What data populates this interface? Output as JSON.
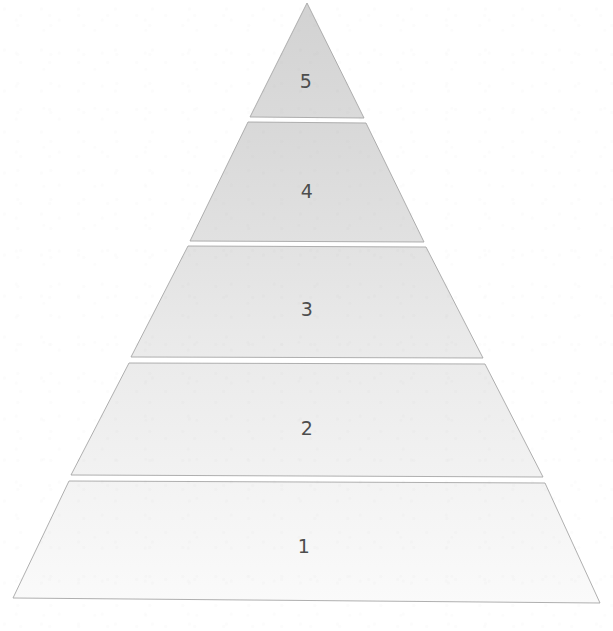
{
  "figure": {
    "type": "pyramid-diagram",
    "title": "",
    "orientation": "apex-up",
    "level_count": 5,
    "background_color": "#ffffff",
    "outline_color": "#9a9a9a",
    "label_color": "#4d4d4d",
    "divider_gap_color": "#ffffff",
    "apex": {
      "x": 307,
      "y": 3
    },
    "base_left": {
      "x": 13,
      "y": 598
    },
    "base_right": {
      "x": 600,
      "y": 603
    },
    "levels": [
      {
        "label": "5",
        "rank_from_top": 1,
        "fill_color": "#d7d7d7",
        "top_y": 3,
        "bottom_y": 117,
        "label_x": 306,
        "label_y": 81
      },
      {
        "label": "4",
        "rank_from_top": 2,
        "fill_color": "#dcdcdc",
        "top_y": 122,
        "bottom_y": 241,
        "label_x": 307,
        "label_y": 191
      },
      {
        "label": "3",
        "rank_from_top": 3,
        "fill_color": "#e6e6e6",
        "top_y": 246,
        "bottom_y": 357,
        "label_x": 307,
        "label_y": 309
      },
      {
        "label": "2",
        "rank_from_top": 4,
        "fill_color": "#eeeeee",
        "top_y": 363,
        "bottom_y": 475,
        "label_x": 307,
        "label_y": 428
      },
      {
        "label": "1",
        "rank_from_top": 5,
        "fill_color": "#f6f6f6",
        "top_y": 481,
        "bottom_y": 600,
        "label_x": 304,
        "label_y": 546
      }
    ]
  },
  "artifacts": {
    "cropped_header_text": ""
  }
}
